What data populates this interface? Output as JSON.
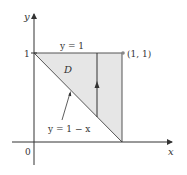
{
  "figure": {
    "type": "region-of-integration",
    "axes": {
      "x_label": "x",
      "y_label": "y",
      "origin_label": "0",
      "y_tick_label": "1"
    },
    "region": {
      "name": "D",
      "fill_color": "#e6e6e6",
      "vertices": [
        [
          0,
          1
        ],
        [
          1,
          1
        ],
        [
          1,
          0
        ]
      ]
    },
    "curves": {
      "top_label": "y = 1",
      "hypotenuse_label": "y = 1 − x"
    },
    "point": {
      "label": "(1, 1)",
      "x": 1,
      "y": 1
    },
    "vertical_strip": {
      "x": 0.72,
      "direction": "up"
    },
    "colors": {
      "axis": "#333333",
      "line": "#555555",
      "fill": "#e6e6e6",
      "point": "#888888"
    }
  }
}
